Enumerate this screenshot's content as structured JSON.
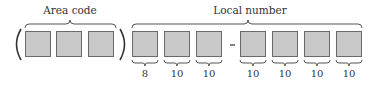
{
  "diagram": {
    "title_area": "Area code",
    "title_local": "Local number",
    "open_paren": "(",
    "close_paren": ")",
    "separator": "-",
    "area_code_boxes": 3,
    "local_number_boxes": 7,
    "local_counts": [
      "8",
      "10",
      "10",
      "10",
      "10",
      "10",
      "10"
    ],
    "colors": {
      "box_fill": "#c8c8c8",
      "box_border": "#6a6a6a",
      "text": "#333333"
    }
  }
}
